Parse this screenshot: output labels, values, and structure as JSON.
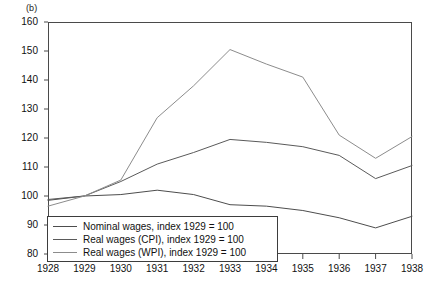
{
  "figure": {
    "panel_label": "(b)"
  },
  "chart_data": {
    "type": "line",
    "title": "",
    "subtitle": "",
    "xlabel": "",
    "ylabel": "",
    "x": [
      1928,
      1929,
      1930,
      1931,
      1932,
      1933,
      1934,
      1935,
      1936,
      1937,
      1938
    ],
    "xtick_labels": [
      "1928",
      "1929",
      "1930",
      "1931",
      "1932",
      "1933",
      "1934",
      "1935",
      "1936",
      "1937",
      "1938"
    ],
    "xlim": [
      1928,
      1938
    ],
    "ylim": [
      80,
      160
    ],
    "ytick_labels": [
      "80",
      "90",
      "100",
      "110",
      "120",
      "130",
      "140",
      "150",
      "160"
    ],
    "yticks": [
      80,
      90,
      100,
      110,
      120,
      130,
      140,
      150,
      160
    ],
    "grid": false,
    "legend_position": "bottom-left",
    "series": [
      {
        "name": "Nominal wages, index 1929 = 100",
        "color": "#4d4d4d",
        "values": [
          98.5,
          100.0,
          100.5,
          102.0,
          100.5,
          97.0,
          96.5,
          95.0,
          92.5,
          89.0,
          93.0
        ]
      },
      {
        "name": "Real wages (CPI), index 1929 = 100",
        "color": "#5a5a5a",
        "values": [
          98.8,
          100.0,
          105.0,
          111.0,
          115.0,
          119.5,
          118.5,
          117.0,
          114.0,
          106.0,
          110.5
        ]
      },
      {
        "name": "Real wages (WPI), index 1929 = 100",
        "color": "#8c8c8c",
        "values": [
          96.5,
          100.0,
          105.5,
          127.0,
          138.0,
          150.5,
          145.5,
          141.0,
          121.0,
          113.0,
          120.5
        ]
      }
    ]
  }
}
